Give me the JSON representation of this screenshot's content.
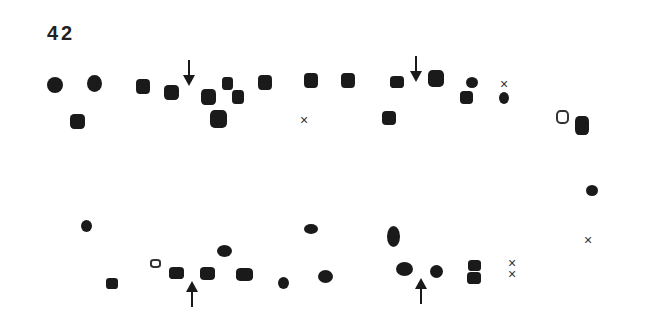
{
  "figure": {
    "label": "42",
    "cross_glyph": "×",
    "colors": {
      "fill": "#1a1a1a",
      "stroke": "#333333",
      "background": "#ffffff"
    },
    "markers": [
      {
        "type": "round",
        "x": 55,
        "y": 85,
        "w": 16,
        "h": 16
      },
      {
        "type": "round",
        "x": 94,
        "y": 83,
        "w": 15,
        "h": 17
      },
      {
        "type": "sq",
        "x": 77,
        "y": 121,
        "w": 15,
        "h": 15
      },
      {
        "type": "sq",
        "x": 143,
        "y": 86,
        "w": 14,
        "h": 15
      },
      {
        "type": "sq",
        "x": 171,
        "y": 92,
        "w": 15,
        "h": 15
      },
      {
        "type": "sq",
        "x": 208,
        "y": 97,
        "w": 15,
        "h": 16
      },
      {
        "type": "sq",
        "x": 227,
        "y": 83,
        "w": 11,
        "h": 13
      },
      {
        "type": "sq",
        "x": 238,
        "y": 97,
        "w": 12,
        "h": 14
      },
      {
        "type": "sq",
        "x": 218,
        "y": 119,
        "w": 17,
        "h": 18
      },
      {
        "type": "sq",
        "x": 265,
        "y": 82,
        "w": 14,
        "h": 15
      },
      {
        "type": "sq",
        "x": 311,
        "y": 80,
        "w": 14,
        "h": 15
      },
      {
        "type": "sq",
        "x": 348,
        "y": 80,
        "w": 14,
        "h": 15
      },
      {
        "type": "sq",
        "x": 397,
        "y": 82,
        "w": 14,
        "h": 12
      },
      {
        "type": "sq",
        "x": 389,
        "y": 118,
        "w": 14,
        "h": 14
      },
      {
        "type": "sq",
        "x": 436,
        "y": 78,
        "w": 16,
        "h": 17
      },
      {
        "type": "round",
        "x": 472,
        "y": 82,
        "w": 12,
        "h": 11
      },
      {
        "type": "sq",
        "x": 466,
        "y": 97,
        "w": 13,
        "h": 13
      },
      {
        "type": "round",
        "x": 504,
        "y": 98,
        "w": 10,
        "h": 12
      },
      {
        "type": "open",
        "x": 562,
        "y": 117,
        "w": 13,
        "h": 14
      },
      {
        "type": "sq",
        "x": 582,
        "y": 125,
        "w": 14,
        "h": 19
      },
      {
        "type": "round",
        "x": 592,
        "y": 190,
        "w": 12,
        "h": 11
      },
      {
        "type": "round",
        "x": 86,
        "y": 226,
        "w": 11,
        "h": 12
      },
      {
        "type": "sq",
        "x": 112,
        "y": 283,
        "w": 12,
        "h": 11
      },
      {
        "type": "open",
        "x": 155,
        "y": 263,
        "w": 11,
        "h": 9
      },
      {
        "type": "sq",
        "x": 176,
        "y": 273,
        "w": 15,
        "h": 12
      },
      {
        "type": "sq",
        "x": 207,
        "y": 273,
        "w": 15,
        "h": 13
      },
      {
        "type": "round",
        "x": 224,
        "y": 251,
        "w": 15,
        "h": 12
      },
      {
        "type": "sq",
        "x": 244,
        "y": 274,
        "w": 17,
        "h": 13
      },
      {
        "type": "round",
        "x": 283,
        "y": 283,
        "w": 11,
        "h": 12
      },
      {
        "type": "round",
        "x": 311,
        "y": 229,
        "w": 14,
        "h": 10
      },
      {
        "type": "round",
        "x": 325,
        "y": 276,
        "w": 15,
        "h": 13
      },
      {
        "type": "round",
        "x": 393,
        "y": 236,
        "w": 13,
        "h": 21
      },
      {
        "type": "round",
        "x": 404,
        "y": 269,
        "w": 17,
        "h": 14
      },
      {
        "type": "round",
        "x": 436,
        "y": 271,
        "w": 13,
        "h": 13
      },
      {
        "type": "sq",
        "x": 474,
        "y": 265,
        "w": 13,
        "h": 11
      },
      {
        "type": "sq",
        "x": 474,
        "y": 278,
        "w": 14,
        "h": 12
      }
    ],
    "crosses": [
      {
        "x": 304,
        "y": 120
      },
      {
        "x": 504,
        "y": 84
      },
      {
        "x": 588,
        "y": 240
      },
      {
        "x": 512,
        "y": 263
      },
      {
        "x": 512,
        "y": 274
      }
    ],
    "arrows": [
      {
        "dir": "down",
        "x": 189,
        "y": 60
      },
      {
        "dir": "down",
        "x": 416,
        "y": 56
      },
      {
        "dir": "up",
        "x": 192,
        "y": 281
      },
      {
        "dir": "up",
        "x": 421,
        "y": 278
      }
    ]
  }
}
